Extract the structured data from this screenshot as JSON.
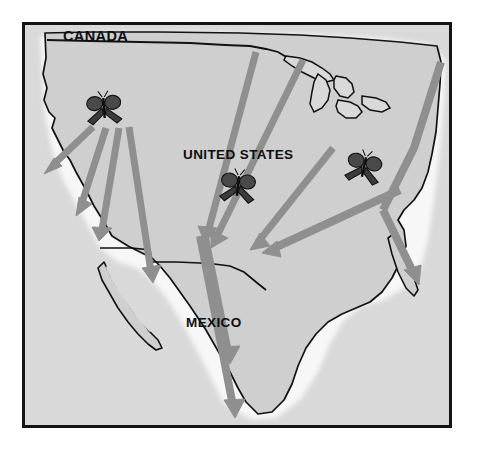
{
  "figure": {
    "kind": "monarch-butterfly-migration-map",
    "width": 479,
    "height": 462
  },
  "frame": {
    "x": 22,
    "y": 22,
    "width": 430,
    "height": 406,
    "border_color": "#141414",
    "border_width": 3
  },
  "colors": {
    "page_background": "#ffffff",
    "ocean": "#d9d9d9",
    "land": "#cfcfcf",
    "land_halo": "#f2f2f2",
    "coastline": "#111111",
    "arrow": "#8f8f8f",
    "arrow_dark": "#7e7e7e",
    "label_text": "#0d0d0d",
    "butterfly_wing": "#3a3a3a",
    "butterfly_body": "#151515"
  },
  "labels": [
    {
      "name": "canada",
      "text": "CANADA",
      "x": 63,
      "y": 28,
      "size": 14.5
    },
    {
      "name": "united-states",
      "text": "UNITED STATES",
      "x": 183,
      "y": 147,
      "size": 13.5
    },
    {
      "name": "mexico",
      "text": "MEXICO",
      "x": 186,
      "y": 315,
      "size": 13.5
    }
  ],
  "butterflies": [
    {
      "name": "butterfly-west",
      "x": 104,
      "y": 108,
      "scale": 1.0,
      "rotate": -4
    },
    {
      "name": "butterfly-central",
      "x": 238,
      "y": 186,
      "scale": 1.0,
      "rotate": 6
    },
    {
      "name": "butterfly-east",
      "x": 364,
      "y": 167,
      "scale": 1.0,
      "rotate": 12
    }
  ],
  "migration_arrows": [
    {
      "name": "arrow-west-to-norcal",
      "x1": 93,
      "y1": 127,
      "x2": 48,
      "y2": 170,
      "width": 7
    },
    {
      "name": "arrow-west-to-central-cal",
      "x1": 105,
      "y1": 128,
      "x2": 78,
      "y2": 212,
      "width": 7
    },
    {
      "name": "arrow-west-to-socal",
      "x1": 118,
      "y1": 128,
      "x2": 100,
      "y2": 236,
      "width": 7
    },
    {
      "name": "arrow-west-to-baja",
      "x1": 128,
      "y1": 127,
      "x2": 153,
      "y2": 278,
      "width": 7
    },
    {
      "name": "arrow-plains-south",
      "x1": 256,
      "y1": 52,
      "x2": 205,
      "y2": 238,
      "width": 7
    },
    {
      "name": "arrow-midwest-south",
      "x1": 303,
      "y1": 60,
      "x2": 213,
      "y2": 244,
      "width": 7
    },
    {
      "name": "arrow-northeast-southwest",
      "x1": 333,
      "y1": 148,
      "x2": 251,
      "y2": 247,
      "width": 7
    },
    {
      "name": "arrow-east-southwest",
      "x1": 400,
      "y1": 190,
      "x2": 265,
      "y2": 252,
      "width": 8
    },
    {
      "name": "arrow-atlantic-coast",
      "x1": 441,
      "y1": 62,
      "x2": 381,
      "y2": 215,
      "width": 8,
      "via": [
        {
          "x": 414,
          "y": 148
        },
        {
          "x": 381,
          "y": 214
        }
      ],
      "bend": true
    },
    {
      "name": "arrow-florida",
      "x1": 381,
      "y1": 214,
      "x2": 418,
      "y2": 282,
      "width": 8
    },
    {
      "name": "arrow-into-mexico-short",
      "x1": 205,
      "y1": 238,
      "x2": 230,
      "y2": 362,
      "width": 8
    },
    {
      "name": "arrow-into-mexico-long",
      "x1": 200,
      "y1": 236,
      "x2": 234,
      "y2": 416,
      "width": 8
    }
  ]
}
